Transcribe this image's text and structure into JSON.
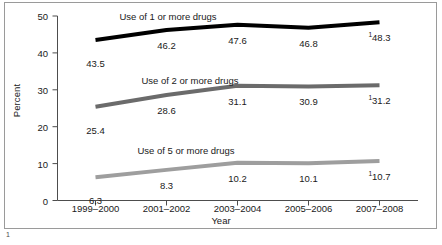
{
  "chart_data": {
    "type": "line",
    "title": "",
    "xlabel": "Year",
    "ylabel": "Percent",
    "ylim": [
      0,
      50
    ],
    "yticks": [
      0,
      10,
      20,
      30,
      40,
      50
    ],
    "ytick_labels": [
      "0",
      "10",
      "20",
      "30",
      "40",
      "50"
    ],
    "grid": false,
    "legend_position": "inline-above-series",
    "categories": [
      "1999–2000",
      "2001–2002",
      "2003–2004",
      "2005–2006",
      "2007–2008"
    ],
    "series": [
      {
        "name": "Use of 1 or more drugs",
        "color": "#000000",
        "values": [
          43.5,
          46.2,
          47.6,
          46.8,
          48.3
        ],
        "point_labels": [
          "43.5",
          "46.2",
          "47.6",
          "46.8",
          "48.3"
        ],
        "footnote_marks": [
          "",
          "",
          "",
          "",
          "1"
        ]
      },
      {
        "name": "Use of 2 or more drugs",
        "color": "#6b6b6b",
        "values": [
          25.4,
          28.6,
          31.1,
          30.9,
          31.2
        ],
        "point_labels": [
          "25.4",
          "28.6",
          "31.1",
          "30.9",
          "31.2"
        ],
        "footnote_marks": [
          "",
          "",
          "",
          "",
          "1"
        ]
      },
      {
        "name": "Use of 5 or more drugs",
        "color": "#9e9e9e",
        "values": [
          6.3,
          8.3,
          10.2,
          10.1,
          10.7
        ],
        "point_labels": [
          "6.3",
          "8.3",
          "10.2",
          "10.1",
          "10.7"
        ],
        "footnote_marks": [
          "",
          "",
          "",
          "",
          "1"
        ]
      }
    ],
    "footnote_marker": "1"
  },
  "axes": {
    "y_title": "Percent",
    "x_title": "Year"
  },
  "colors": {
    "frame": "#9a9a9a",
    "axis": "#4d4d4d",
    "text": "#1a1a1a",
    "series_1": "#000000",
    "series_2": "#6b6b6b",
    "series_3": "#9e9e9e"
  }
}
